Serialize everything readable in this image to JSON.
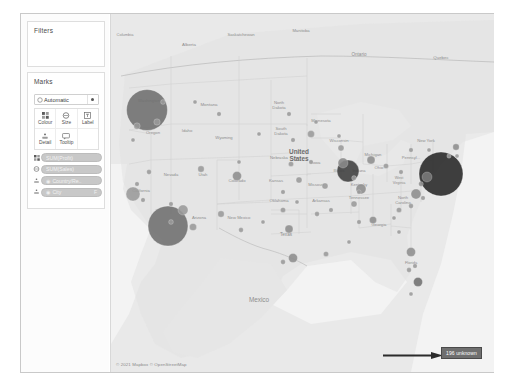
{
  "app": {
    "title": "Tableau Map Worksheet"
  },
  "shelf": {
    "filters": {
      "title": "Filters",
      "items": []
    },
    "marks": {
      "title": "Marks",
      "mark_type": {
        "label": "Automatic",
        "icon": "mark-type-icon",
        "caret": "chevron-down-icon"
      },
      "properties": [
        {
          "label": "Colour",
          "icon": "colour-icon"
        },
        {
          "label": "Size",
          "icon": "size-icon"
        },
        {
          "label": "Label",
          "icon": "label-icon"
        },
        {
          "label": "Detail",
          "icon": "detail-icon"
        },
        {
          "label": "Tooltip",
          "icon": "tooltip-icon"
        }
      ],
      "pills": [
        {
          "label": "SUM(Profit)",
          "prop_icon": "colour-icon",
          "flag": ""
        },
        {
          "label": "SUM(Sales)",
          "prop_icon": "size-icon",
          "flag": ""
        },
        {
          "label": "Country/Re..",
          "prop_icon": "detail-icon",
          "flag": "",
          "field_icon": "geo-field-icon"
        },
        {
          "label": "City",
          "prop_icon": "detail-icon",
          "flag": "F",
          "field_icon": "geo-field-icon"
        }
      ]
    }
  },
  "map": {
    "attribution": "© 2021 Mapbox © OpenStreetMap",
    "labels": [
      {
        "text": "Columbia",
        "x": 14,
        "y": 22,
        "size": 4.0,
        "italic": false
      },
      {
        "text": "Alberta",
        "x": 78,
        "y": 32,
        "size": 4.4
      },
      {
        "text": "Saskatchewan",
        "x": 130,
        "y": 22,
        "size": 4.2
      },
      {
        "text": "Manitoba",
        "x": 190,
        "y": 18,
        "size": 4.2
      },
      {
        "text": "Ontario",
        "x": 248,
        "y": 42,
        "size": 4.6
      },
      {
        "text": "Quebec",
        "x": 330,
        "y": 45,
        "size": 4.4
      },
      {
        "text": "Washington",
        "x": 38,
        "y": 88,
        "size": 4.2
      },
      {
        "text": "Montana",
        "x": 98,
        "y": 92,
        "size": 4.4
      },
      {
        "text": "North\nDakota",
        "x": 168,
        "y": 90,
        "size": 4.2
      },
      {
        "text": "Minnesota",
        "x": 210,
        "y": 108,
        "size": 4.2
      },
      {
        "text": "Oregon",
        "x": 42,
        "y": 120,
        "size": 4.2
      },
      {
        "text": "Idaho",
        "x": 76,
        "y": 118,
        "size": 4.2
      },
      {
        "text": "Wyoming",
        "x": 113,
        "y": 125,
        "size": 4.2
      },
      {
        "text": "South\nDakota",
        "x": 170,
        "y": 116,
        "size": 4.2
      },
      {
        "text": "Wisconsin",
        "x": 228,
        "y": 128,
        "size": 4.2
      },
      {
        "text": "Michigan",
        "x": 262,
        "y": 142,
        "size": 4.2
      },
      {
        "text": "Nevada",
        "x": 60,
        "y": 162,
        "size": 4.2
      },
      {
        "text": "Utah",
        "x": 92,
        "y": 162,
        "size": 4.2
      },
      {
        "text": "Colorado",
        "x": 126,
        "y": 168,
        "size": 4.2
      },
      {
        "text": "Nebraska",
        "x": 168,
        "y": 145,
        "size": 4.2
      },
      {
        "text": "Iowa",
        "x": 205,
        "y": 150,
        "size": 4.2
      },
      {
        "text": "Illinois",
        "x": 228,
        "y": 158,
        "size": 4.0
      },
      {
        "text": "Indiana",
        "x": 248,
        "y": 158,
        "size": 4.0
      },
      {
        "text": "Ohio",
        "x": 268,
        "y": 155,
        "size": 4.2
      },
      {
        "text": "United\nStates",
        "x": 188,
        "y": 140,
        "size": 6.4,
        "bold": true
      },
      {
        "text": "Missouri",
        "x": 205,
        "y": 172,
        "size": 4.2
      },
      {
        "text": "Kentucky",
        "x": 248,
        "y": 172,
        "size": 4.0
      },
      {
        "text": "Kansas",
        "x": 165,
        "y": 168,
        "size": 4.2
      },
      {
        "text": "Oklahoma",
        "x": 168,
        "y": 188,
        "size": 4.2
      },
      {
        "text": "Arkansas",
        "x": 210,
        "y": 188,
        "size": 4.2
      },
      {
        "text": "Tennessee",
        "x": 248,
        "y": 185,
        "size": 4.2
      },
      {
        "text": "North\nCarolina",
        "x": 292,
        "y": 185,
        "size": 4.2
      },
      {
        "text": "West\nVirginia",
        "x": 288,
        "y": 165,
        "size": 3.8
      },
      {
        "text": "Pennsyl...",
        "x": 300,
        "y": 145,
        "size": 4.2
      },
      {
        "text": "New York",
        "x": 315,
        "y": 128,
        "size": 4.2
      },
      {
        "text": "Arizona",
        "x": 88,
        "y": 205,
        "size": 4.2
      },
      {
        "text": "New Mexico",
        "x": 128,
        "y": 205,
        "size": 4.2
      },
      {
        "text": "Texas",
        "x": 175,
        "y": 222,
        "size": 4.6
      },
      {
        "text": "Georgia",
        "x": 268,
        "y": 212,
        "size": 4.2
      },
      {
        "text": "Mexico",
        "x": 148,
        "y": 288,
        "size": 6.4
      },
      {
        "text": "California",
        "x": 30,
        "y": 178,
        "size": 4.2
      },
      {
        "text": "Florida",
        "x": 300,
        "y": 250,
        "size": 4.0
      }
    ],
    "marks": [
      {
        "name": "seattle",
        "cx": 36,
        "cy": 96,
        "r": 20.5,
        "fill": "#6e6e6e",
        "label": ""
      },
      {
        "name": "los-angeles",
        "cx": 57,
        "cy": 212,
        "r": 20.0,
        "fill": "#6e6e6e",
        "label": ""
      },
      {
        "name": "new-york-city",
        "cx": 330,
        "cy": 160,
        "r": 22.0,
        "fill": "#262626",
        "label": ""
      },
      {
        "name": "chicago",
        "cx": 237,
        "cy": 157,
        "r": 11.0,
        "fill": "#3d3d3d",
        "label": ""
      },
      {
        "name": "chicago-inner",
        "cx": 232,
        "cy": 149,
        "r": 5.0,
        "fill": "#8a8a8a",
        "label": ""
      },
      {
        "name": "san-francisco",
        "cx": 22,
        "cy": 180,
        "r": 7.0,
        "fill": "#9a9a9a",
        "label": ""
      },
      {
        "name": "phoenix",
        "cx": 72,
        "cy": 196,
        "r": 5.0,
        "fill": "#9a9a9a",
        "label": ""
      },
      {
        "name": "columbus",
        "cx": 250,
        "cy": 175,
        "r": 5.0,
        "fill": "#8d8d8d",
        "label": ""
      },
      {
        "name": "philadelphia",
        "cx": 316,
        "cy": 163,
        "r": 5.0,
        "fill": "#7a7a7a",
        "label": ""
      },
      {
        "name": "detroit",
        "cx": 260,
        "cy": 146,
        "r": 4.0,
        "fill": "#8d8d8d",
        "label": ""
      },
      {
        "name": "houston",
        "cx": 182,
        "cy": 244,
        "r": 4.5,
        "fill": "#8d8d8d",
        "label": ""
      },
      {
        "name": "dallas",
        "cx": 178,
        "cy": 215,
        "r": 4.0,
        "fill": "#8d8d8d",
        "label": ""
      },
      {
        "name": "denver",
        "cx": 126,
        "cy": 162,
        "r": 4.5,
        "fill": "#8d8d8d",
        "label": ""
      },
      {
        "name": "jacksonville",
        "cx": 300,
        "cy": 238,
        "r": 4.5,
        "fill": "#8d8d8d",
        "label": ""
      },
      {
        "name": "miami",
        "cx": 307,
        "cy": 268,
        "r": 4.5,
        "fill": "#6f6f6f",
        "label": ""
      },
      {
        "name": "richmond",
        "cx": 305,
        "cy": 180,
        "r": 5.0,
        "fill": "#8d8d8d",
        "label": ""
      },
      {
        "name": "minneapolis",
        "cx": 200,
        "cy": 120,
        "r": 3.5,
        "fill": "#9a9a9a",
        "label": ""
      },
      {
        "name": "salt-lake",
        "cx": 90,
        "cy": 155,
        "r": 3.2,
        "fill": "#9a9a9a",
        "label": ""
      },
      {
        "name": "portland",
        "cx": 26,
        "cy": 112,
        "r": 3.2,
        "fill": "#9a9a9a",
        "label": ""
      },
      {
        "name": "boise",
        "cx": 46,
        "cy": 108,
        "r": 3.2,
        "fill": "#9a9a9a",
        "label": ""
      },
      {
        "name": "tucson",
        "cx": 82,
        "cy": 213,
        "r": 3.6,
        "fill": "#9a9a9a",
        "label": ""
      },
      {
        "name": "albuquerque",
        "cx": 110,
        "cy": 200,
        "r": 3.2,
        "fill": "#9a9a9a",
        "label": ""
      },
      {
        "name": "atlanta",
        "cx": 262,
        "cy": 206,
        "r": 3.6,
        "fill": "#8d8d8d",
        "label": ""
      },
      {
        "name": "nashville",
        "cx": 243,
        "cy": 190,
        "r": 3.0,
        "fill": "#9a9a9a",
        "label": ""
      },
      {
        "name": "st-louis",
        "cx": 214,
        "cy": 172,
        "r": 3.0,
        "fill": "#9a9a9a",
        "label": ""
      },
      {
        "name": "kansas-city",
        "cx": 188,
        "cy": 166,
        "r": 3.0,
        "fill": "#9a9a9a",
        "label": ""
      },
      {
        "name": "omaha",
        "cx": 180,
        "cy": 150,
        "r": 2.6,
        "fill": "#9a9a9a",
        "label": ""
      },
      {
        "name": "milwaukee",
        "cx": 230,
        "cy": 134,
        "r": 3.0,
        "fill": "#9a9a9a",
        "label": ""
      },
      {
        "name": "cleveland",
        "cx": 275,
        "cy": 152,
        "r": 2.6,
        "fill": "#9a9a9a",
        "label": ""
      },
      {
        "name": "boston",
        "cx": 345,
        "cy": 133,
        "r": 3.2,
        "fill": "#8d8d8d",
        "label": ""
      },
      {
        "name": "charlotte",
        "cx": 288,
        "cy": 196,
        "r": 2.6,
        "fill": "#9a9a9a",
        "label": ""
      },
      {
        "name": "new-orleans",
        "cx": 215,
        "cy": 240,
        "r": 2.6,
        "fill": "#9a9a9a",
        "label": ""
      },
      {
        "name": "okc",
        "cx": 172,
        "cy": 196,
        "r": 2.6,
        "fill": "#9a9a9a",
        "label": ""
      },
      {
        "name": "little-rock",
        "cx": 206,
        "cy": 200,
        "r": 2.4,
        "fill": "#9a9a9a",
        "label": ""
      },
      {
        "name": "billings",
        "cx": 108,
        "cy": 100,
        "r": 2.2,
        "fill": "#9a9a9a",
        "label": ""
      },
      {
        "name": "fargo",
        "cx": 178,
        "cy": 100,
        "r": 2.2,
        "fill": "#9a9a9a",
        "label": ""
      },
      {
        "name": "sioux-falls",
        "cx": 182,
        "cy": 126,
        "r": 2.2,
        "fill": "#9a9a9a",
        "label": ""
      },
      {
        "name": "spokane",
        "cx": 52,
        "cy": 88,
        "r": 2.4,
        "fill": "#9a9a9a",
        "label": ""
      },
      {
        "name": "reno",
        "cx": 38,
        "cy": 158,
        "r": 2.4,
        "fill": "#9a9a9a",
        "label": ""
      },
      {
        "name": "san-diego",
        "cx": 60,
        "cy": 208,
        "r": 2.4,
        "fill": "#9a9a9a",
        "label": ""
      },
      {
        "name": "el-paso",
        "cx": 130,
        "cy": 216,
        "r": 2.4,
        "fill": "#9a9a9a",
        "label": ""
      },
      {
        "name": "san-antonio",
        "cx": 172,
        "cy": 248,
        "r": 2.4,
        "fill": "#9a9a9a",
        "label": ""
      },
      {
        "name": "tampa",
        "cx": 298,
        "cy": 256,
        "r": 2.4,
        "fill": "#9a9a9a",
        "label": ""
      },
      {
        "name": "raleigh",
        "cx": 300,
        "cy": 192,
        "r": 2.4,
        "fill": "#9a9a9a",
        "label": ""
      },
      {
        "name": "buffalo",
        "cx": 300,
        "cy": 136,
        "r": 2.2,
        "fill": "#9a9a9a",
        "label": ""
      },
      {
        "name": "indianapolis",
        "cx": 243,
        "cy": 164,
        "r": 2.4,
        "fill": "#9a9a9a",
        "label": ""
      },
      {
        "name": "memphis",
        "cx": 220,
        "cy": 196,
        "r": 2.2,
        "fill": "#9a9a9a",
        "label": ""
      },
      {
        "name": "louisville",
        "cx": 248,
        "cy": 178,
        "r": 2.2,
        "fill": "#9a9a9a",
        "label": ""
      },
      {
        "name": "des-moines",
        "cx": 200,
        "cy": 148,
        "r": 2.2,
        "fill": "#9a9a9a",
        "label": ""
      },
      {
        "name": "wichita",
        "cx": 172,
        "cy": 178,
        "r": 2.2,
        "fill": "#9a9a9a",
        "label": ""
      },
      {
        "name": "fresno",
        "cx": 32,
        "cy": 186,
        "r": 2.2,
        "fill": "#9a9a9a",
        "label": ""
      },
      {
        "name": "sacramento",
        "cx": 26,
        "cy": 170,
        "r": 2.2,
        "fill": "#9a9a9a",
        "label": ""
      },
      {
        "name": "vegas",
        "cx": 60,
        "cy": 190,
        "r": 2.2,
        "fill": "#9a9a9a",
        "label": ""
      },
      {
        "name": "birmingham",
        "cx": 248,
        "cy": 208,
        "r": 2.2,
        "fill": "#9a9a9a",
        "label": ""
      },
      {
        "name": "norfolk",
        "cx": 312,
        "cy": 184,
        "r": 2.2,
        "fill": "#9a9a9a",
        "label": ""
      },
      {
        "name": "baltimore",
        "cx": 310,
        "cy": 170,
        "r": 2.4,
        "fill": "#8d8d8d",
        "label": ""
      },
      {
        "name": "hartford",
        "cx": 338,
        "cy": 142,
        "r": 2.2,
        "fill": "#9a9a9a",
        "label": ""
      },
      {
        "name": "orlando",
        "cx": 304,
        "cy": 252,
        "r": 2.2,
        "fill": "#9a9a9a",
        "label": ""
      },
      {
        "name": "mobile",
        "cx": 238,
        "cy": 228,
        "r": 2.0,
        "fill": "#9a9a9a",
        "label": ""
      },
      {
        "name": "columbia-sc",
        "cx": 283,
        "cy": 204,
        "r": 2.0,
        "fill": "#9a9a9a",
        "label": ""
      },
      {
        "name": "tulsa",
        "cx": 186,
        "cy": 188,
        "r": 2.0,
        "fill": "#9a9a9a",
        "label": ""
      },
      {
        "name": "lubbock",
        "cx": 152,
        "cy": 208,
        "r": 2.0,
        "fill": "#9a9a9a",
        "label": ""
      },
      {
        "name": "cheyenne",
        "cx": 128,
        "cy": 148,
        "r": 2.0,
        "fill": "#9a9a9a",
        "label": ""
      },
      {
        "name": "eugene",
        "cx": 22,
        "cy": 126,
        "r": 2.0,
        "fill": "#9a9a9a",
        "label": ""
      },
      {
        "name": "helena",
        "cx": 84,
        "cy": 88,
        "r": 2.0,
        "fill": "#9a9a9a",
        "label": ""
      },
      {
        "name": "rapid-city",
        "cx": 148,
        "cy": 120,
        "r": 2.0,
        "fill": "#9a9a9a",
        "label": ""
      },
      {
        "name": "duluth",
        "cx": 205,
        "cy": 108,
        "r": 2.0,
        "fill": "#9a9a9a",
        "label": ""
      },
      {
        "name": "green-bay",
        "cx": 228,
        "cy": 122,
        "r": 2.0,
        "fill": "#9a9a9a",
        "label": ""
      },
      {
        "name": "pittsburgh",
        "cx": 290,
        "cy": 158,
        "r": 2.2,
        "fill": "#9a9a9a",
        "label": ""
      },
      {
        "name": "syracuse",
        "cx": 318,
        "cy": 136,
        "r": 2.0,
        "fill": "#9a9a9a",
        "label": ""
      },
      {
        "name": "providence",
        "cx": 346,
        "cy": 142,
        "r": 2.0,
        "fill": "#9a9a9a",
        "label": ""
      },
      {
        "name": "key-west",
        "cx": 300,
        "cy": 280,
        "r": 2.0,
        "fill": "#9a9a9a",
        "label": ""
      },
      {
        "name": "savannah",
        "cx": 288,
        "cy": 218,
        "r": 2.0,
        "fill": "#9a9a9a",
        "label": ""
      }
    ]
  },
  "annotation": {
    "arrow": "right-arrow-annotation",
    "badge_label": "196 unknown"
  }
}
